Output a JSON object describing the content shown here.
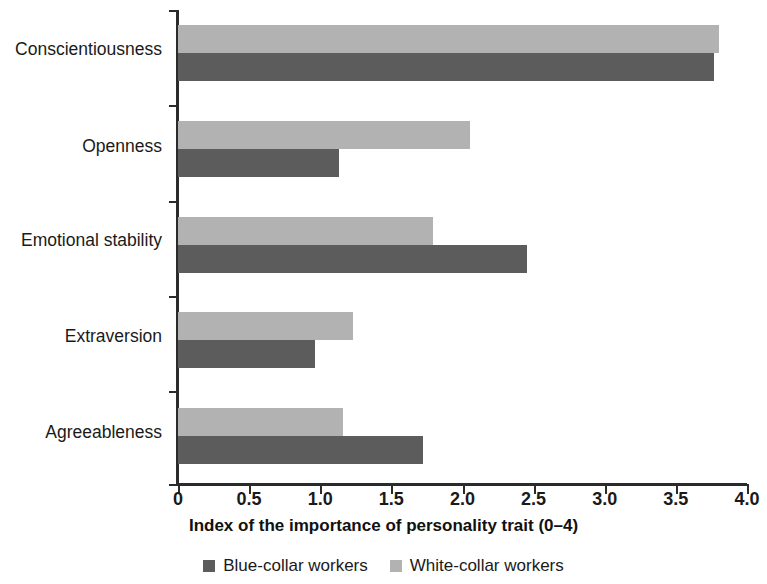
{
  "chart_data": {
    "type": "bar",
    "orientation": "horizontal",
    "title": "",
    "xlabel": "Index of the importance of personality trait (0–4)",
    "ylabel": "",
    "xlim": [
      0,
      4.0
    ],
    "xticks": [
      "0",
      "0.5",
      "1.0",
      "1.5",
      "2.0",
      "2.5",
      "3.0",
      "3.5",
      "4.0"
    ],
    "xtick_values": [
      0,
      0.5,
      1.0,
      1.5,
      2.0,
      2.5,
      3.0,
      3.5,
      4.0
    ],
    "grid": false,
    "legend_position": "bottom",
    "categories": [
      "Conscientiousness",
      "Openness",
      "Emotional stability",
      "Extraversion",
      "Agreeableness"
    ],
    "series": [
      {
        "name": "Blue-collar workers",
        "color": "#5c5c5c",
        "values": [
          3.77,
          1.13,
          2.45,
          0.96,
          1.72
        ]
      },
      {
        "name": "White-collar workers",
        "color": "#b2b2b2",
        "values": [
          3.8,
          2.05,
          1.79,
          1.23,
          1.16
        ]
      }
    ]
  },
  "legend": {
    "items": [
      {
        "label": "Blue-collar workers",
        "swatch": "dark-gray-swatch"
      },
      {
        "label": "White-collar workers",
        "swatch": "light-gray-swatch"
      }
    ]
  }
}
